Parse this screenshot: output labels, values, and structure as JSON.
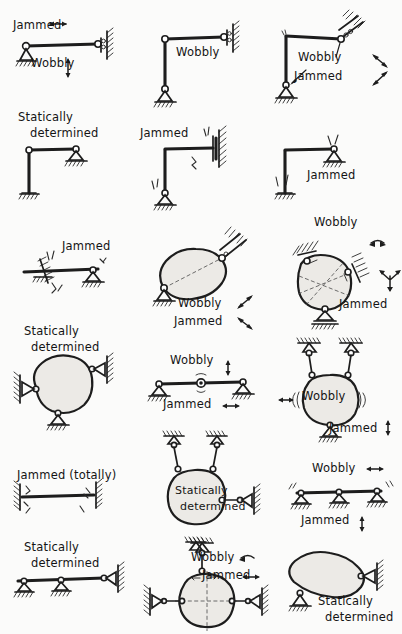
{
  "figure": {
    "ink_color": "#1d1d1d",
    "paper_color": "#fbfbfa",
    "body_fill": "#eceae6",
    "columns": 3,
    "rows": 6
  },
  "terms": {
    "jammed": "Jammed",
    "wobbly": "Wobbly",
    "statically": "Statically",
    "determined": "determined",
    "jammed_totally": "Jammed (totally)"
  },
  "cells": [
    {
      "id": "r1c1",
      "structure": "horizontal-bar-pin-and-wall-roller",
      "labels": [
        {
          "name": "label-jammed",
          "text": "Jammed",
          "arrow": "horizontal-double"
        },
        {
          "name": "label-wobbly",
          "text": "Wobbly",
          "arrow": "vertical-double"
        }
      ]
    },
    {
      "id": "r1c2",
      "structure": "L-frame-pin-base-wall-roller",
      "labels": [
        {
          "name": "label-wobbly",
          "text": "Wobbly",
          "arrow": "none"
        }
      ]
    },
    {
      "id": "r1c3",
      "structure": "L-frame-pin-base-inclined-roller",
      "labels": [
        {
          "name": "label-wobbly",
          "text": "Wobbly",
          "arrow": "diagonal-double"
        },
        {
          "name": "label-jammed",
          "text": "Jammed",
          "arrow": "diagonal-double"
        }
      ]
    },
    {
      "id": "r2c1",
      "structure": "L-frame-fixed-base-roller-support",
      "labels": [
        {
          "name": "label-statically",
          "text": "Statically",
          "arrow": "none"
        },
        {
          "name": "label-determined",
          "text": "determined",
          "arrow": "none"
        }
      ]
    },
    {
      "id": "r2c2",
      "structure": "L-frame-pin-base-fixed-wall",
      "labels": [
        {
          "name": "label-jammed",
          "text": "Jammed",
          "arrow": "none"
        }
      ]
    },
    {
      "id": "r2c3",
      "structure": "L-frame-fixed-base-pin-top",
      "labels": [
        {
          "name": "label-jammed",
          "text": "Jammed",
          "arrow": "none"
        }
      ]
    },
    {
      "id": "r3c1",
      "structure": "horizontal-bar-sliding-wall-and-pin",
      "labels": [
        {
          "name": "label-jammed",
          "text": "Jammed",
          "arrow": "none"
        }
      ]
    },
    {
      "id": "r3c2",
      "structure": "blob-pin-base-inclined-roller-top",
      "labels": [
        {
          "name": "label-wobbly",
          "text": "Wobbly",
          "arrow": "diagonal-double"
        },
        {
          "name": "label-jammed",
          "text": "Jammed",
          "arrow": "diagonal-double"
        }
      ]
    },
    {
      "id": "r3c3",
      "structure": "blob-three-inclined-supports",
      "labels": [
        {
          "name": "label-wobbly",
          "text": "Wobbly",
          "arrow": "curved"
        },
        {
          "name": "label-jammed",
          "text": "Jammed",
          "arrow": "three-way"
        }
      ]
    },
    {
      "id": "r4c1",
      "structure": "blob-two-horizontal-links-and-base-roller",
      "labels": [
        {
          "name": "label-statically",
          "text": "Statically",
          "arrow": "none"
        },
        {
          "name": "label-determined",
          "text": "determined",
          "arrow": "none"
        }
      ]
    },
    {
      "id": "r4c2",
      "structure": "simple-beam-two-pins-and-mid-hinge",
      "labels": [
        {
          "name": "label-wobbly",
          "text": "Wobbly",
          "arrow": "vertical-double"
        },
        {
          "name": "label-jammed",
          "text": "Jammed",
          "arrow": "horizontal-double"
        }
      ]
    },
    {
      "id": "r4c3",
      "structure": "blob-two-hangers-and-base-pin",
      "labels": [
        {
          "name": "label-wobbly",
          "text": "Wobbly",
          "arrow": "horizontal-double"
        },
        {
          "name": "label-jammed",
          "text": "Jammed",
          "arrow": "vertical-double"
        }
      ]
    },
    {
      "id": "r5c1",
      "structure": "bar-fixed-at-both-ends",
      "labels": [
        {
          "name": "label-jammed-totally",
          "text": "Jammed (totally)",
          "arrow": "none"
        }
      ]
    },
    {
      "id": "r5c2",
      "structure": "blob-two-hangers-and-horizontal-link",
      "labels": [
        {
          "name": "label-statically",
          "text": "Statically",
          "arrow": "none"
        },
        {
          "name": "label-determined",
          "text": "determined",
          "arrow": "none"
        }
      ]
    },
    {
      "id": "r5c3",
      "structure": "beam-on-three-rollers",
      "labels": [
        {
          "name": "label-wobbly",
          "text": "Wobbly",
          "arrow": "horizontal-double"
        },
        {
          "name": "label-jammed",
          "text": "Jammed",
          "arrow": "vertical-double"
        }
      ]
    },
    {
      "id": "r6c1",
      "structure": "beam-two-rollers-and-wall-link",
      "labels": [
        {
          "name": "label-statically",
          "text": "Statically",
          "arrow": "none"
        },
        {
          "name": "label-determined",
          "text": "determined",
          "arrow": "none"
        }
      ]
    },
    {
      "id": "r6c2",
      "structure": "blob-top-hanger-and-two-side-links",
      "labels": [
        {
          "name": "label-wobbly",
          "text": "Wobbly",
          "arrow": "curved"
        },
        {
          "name": "label-jammed",
          "text": "Jammed",
          "arrow": "horizontal-double"
        }
      ]
    },
    {
      "id": "r6c3",
      "structure": "blob-base-pin-and-wall-link",
      "labels": [
        {
          "name": "label-statically",
          "text": "Statically",
          "arrow": "none"
        },
        {
          "name": "label-determined",
          "text": "determined",
          "arrow": "none"
        }
      ]
    }
  ]
}
